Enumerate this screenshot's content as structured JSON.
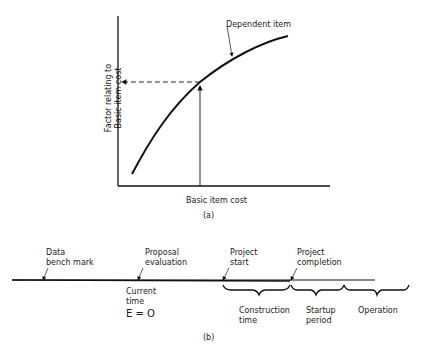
{
  "figure_a": {
    "caption": "(a)",
    "xlabel": "Basic item cost",
    "ylabel_line1": "Factor relating to",
    "ylabel_line2": "Basic item cost",
    "curve_label": "Dependent item"
  },
  "figure_b": {
    "caption": "(b)",
    "markers": [
      {
        "label_line1": "Data",
        "label_line2": "bench mark"
      },
      {
        "label_line1": "Proposal",
        "label_line2": "evaluation"
      },
      {
        "label_line1": "Project",
        "label_line2": "start"
      },
      {
        "label_line1": "Project",
        "label_line2": "completion"
      }
    ],
    "current_time": {
      "line1": "Current",
      "line2": "time",
      "line3": "E = O"
    },
    "periods": [
      {
        "line1": "Construction",
        "line2": "time"
      },
      {
        "line1": "Startup",
        "line2": "period"
      },
      {
        "line1": "Operation",
        "line2": ""
      }
    ]
  }
}
